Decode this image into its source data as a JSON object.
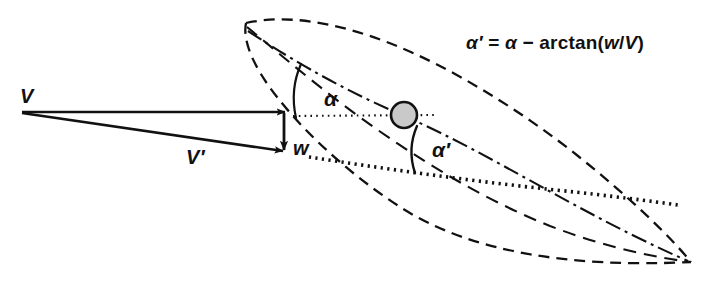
{
  "figure": {
    "name": "airfoil-induced-angle-of-attack-diagram",
    "type": "vector-and-airfoil-geometry-diagram",
    "background_color": "#ffffff",
    "ink_color": "#111111",
    "width": 711,
    "height": 286
  },
  "equation": {
    "full_text": "α' = α − arctan(w/V)",
    "lhs": "α′",
    "equals": "=",
    "rhs_alpha": "α",
    "minus": "−",
    "function_name": "arctan",
    "open_paren": "(",
    "numerator": "w",
    "slash": "/",
    "denominator": "V",
    "close_paren": ")"
  },
  "labels": {
    "free_stream_velocity": "V",
    "effective_velocity": "V′",
    "downwash": "w",
    "geometric_angle_of_attack": "α",
    "effective_angle_of_attack": "α′"
  },
  "elements": {
    "airfoil_outline": {
      "name": "airfoil-section-outline",
      "stroke_style": "dashed",
      "color": "#111111"
    },
    "chord_line": {
      "name": "chord-line",
      "stroke_style": "dash-dot",
      "color": "#111111"
    },
    "camber_line": {
      "name": "camber-line",
      "stroke_style": "dashed",
      "color": "#111111"
    },
    "reference_line_upper": {
      "name": "horizontal-reference-line-upper",
      "stroke_style": "dotted",
      "color": "#111111"
    },
    "reference_line_lower": {
      "name": "effective-flow-reference-line-lower",
      "stroke_style": "dotted-bold",
      "color": "#111111"
    },
    "pivot_marker": {
      "name": "quarter-chord-pivot-circle",
      "fill": "#c9c9c9",
      "stroke": "#111111"
    },
    "vector_V": {
      "name": "free-stream-velocity-vector",
      "arrow": true,
      "color": "#111111"
    },
    "vector_Vprime": {
      "name": "effective-velocity-vector",
      "arrow": true,
      "color": "#111111"
    },
    "vector_w": {
      "name": "downwash-velocity-vector",
      "arrow": true,
      "color": "#111111"
    },
    "angle_arc_alpha": {
      "name": "angle-arc-alpha",
      "color": "#111111"
    },
    "angle_arc_alpha_prime": {
      "name": "angle-arc-alpha-prime",
      "color": "#111111"
    }
  }
}
